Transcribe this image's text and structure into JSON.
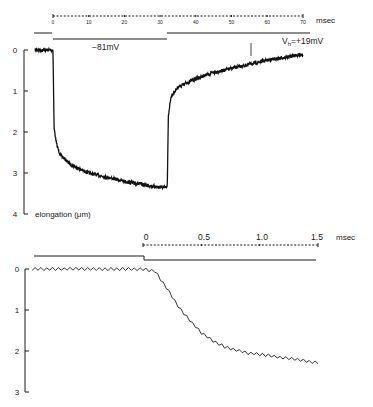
{
  "chart_data": [
    {
      "type": "line",
      "title": "",
      "xlabel": "msec",
      "ylabel": "elongation (μm)",
      "xlim": [
        0,
        70
      ],
      "ylim": [
        0,
        4
      ],
      "y_inverted": true,
      "x_ticks": [
        "0",
        "10",
        "20",
        "30",
        "40",
        "50",
        "60",
        "70"
      ],
      "y_ticks": [
        "0",
        "1",
        "2",
        "3",
        "4"
      ],
      "x_unit": "msec",
      "voltage_protocol": {
        "hold_label": "V_h=+19mV",
        "step_label": "−81mV",
        "step_start_ms": 0,
        "step_end_ms": 32
      },
      "series": [
        {
          "name": "elongation",
          "x": [
            -5,
            0,
            0.3,
            1,
            2,
            5,
            10,
            15,
            20,
            25,
            30,
            32,
            32.3,
            33,
            35,
            40,
            45,
            50,
            55,
            60,
            65,
            70
          ],
          "values": [
            0,
            0,
            1.9,
            2.3,
            2.55,
            2.8,
            3.0,
            3.1,
            3.2,
            3.28,
            3.35,
            3.35,
            1.6,
            1.15,
            0.9,
            0.7,
            0.55,
            0.45,
            0.35,
            0.25,
            0.18,
            0.1
          ]
        }
      ],
      "grid": false
    },
    {
      "type": "line",
      "title": "",
      "xlabel": "msec",
      "ylabel": "",
      "xlim": [
        0,
        1.5
      ],
      "ylim": [
        0,
        3
      ],
      "y_inverted": true,
      "x_ticks": [
        "0",
        "0.5",
        "1.0",
        "1.5"
      ],
      "y_ticks": [
        "0",
        "1",
        "2",
        "3"
      ],
      "x_unit": "msec",
      "series": [
        {
          "name": "elongation",
          "x": [
            -0.95,
            -0.5,
            0,
            0.1,
            0.2,
            0.3,
            0.4,
            0.5,
            0.6,
            0.7,
            0.8,
            0.9,
            1.0,
            1.1,
            1.2,
            1.3,
            1.4,
            1.5
          ],
          "values": [
            0,
            0,
            0,
            0.05,
            0.45,
            0.9,
            1.25,
            1.55,
            1.75,
            1.9,
            1.98,
            2.05,
            2.08,
            2.12,
            2.17,
            2.2,
            2.25,
            2.28
          ]
        }
      ],
      "grid": false
    }
  ],
  "top_panel": {
    "time_unit": "msec",
    "time_ticks": [
      "0",
      "10",
      "20",
      "30",
      "40",
      "50",
      "60",
      "70"
    ],
    "step_label": "−81mV",
    "hold_label_main": "V",
    "hold_label_sub": "h",
    "hold_label_value": "=+19mV",
    "y_ticks": [
      "0",
      "1",
      "2",
      "3",
      "4"
    ],
    "y_axis_label": "elongation  (μm)"
  },
  "bottom_panel": {
    "time_unit": "msec",
    "time_ticks": [
      "0",
      "0.5",
      "1.0",
      "1.5"
    ],
    "y_ticks": [
      "0",
      "1",
      "2",
      "3"
    ]
  },
  "colors": {
    "ink": "#1a1a1a",
    "background": "#ffffff"
  }
}
